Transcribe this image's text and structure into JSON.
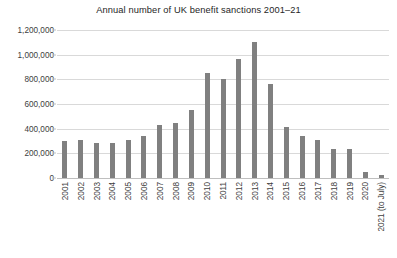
{
  "chart_data": {
    "type": "bar",
    "title": "Annual number of UK benefit sanctions 2001–21",
    "xlabel": "",
    "ylabel": "",
    "ylim": [
      0,
      1200000
    ],
    "grid": true,
    "legend": null,
    "bar_color": "#808080",
    "gridline_color": "#d9d9d9",
    "categories": [
      "2001",
      "2002",
      "2003",
      "2004",
      "2005",
      "2006",
      "2007",
      "2008",
      "2009",
      "2010",
      "2011",
      "2012",
      "2013",
      "2014",
      "2015",
      "2016",
      "2017",
      "2018",
      "2019",
      "2020",
      "2021 (to July)"
    ],
    "values": [
      300000,
      310000,
      280000,
      280000,
      310000,
      340000,
      430000,
      450000,
      550000,
      850000,
      800000,
      965000,
      1100000,
      765000,
      415000,
      340000,
      305000,
      235000,
      235000,
      45000,
      25000
    ],
    "ytick_labels": [
      "0",
      "200,000",
      "400,000",
      "600,000",
      "800,000",
      "1,000,000",
      "1,200,000"
    ],
    "ytick_values": [
      0,
      200000,
      400000,
      600000,
      800000,
      1000000,
      1200000
    ]
  },
  "caption": ""
}
